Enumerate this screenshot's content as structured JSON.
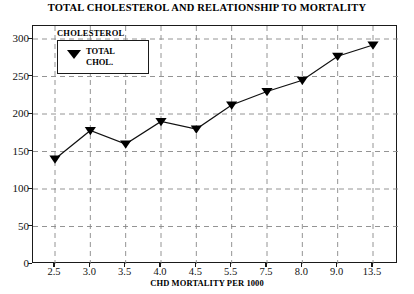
{
  "chart_data": {
    "type": "line",
    "title": "TOTAL CHOLESTEROL AND RELATIONSHIP TO MORTALITY",
    "xlabel": "CHD MORTALITY PER 1000",
    "ylabel": "",
    "categories": [
      "2.5",
      "3.0",
      "3.5",
      "4.0",
      "4.5",
      "5.5",
      "7.5",
      "8.0",
      "9.0",
      "13.5"
    ],
    "values": [
      140,
      178,
      160,
      190,
      180,
      212,
      230,
      245,
      277,
      292
    ],
    "series": [
      {
        "name": "TOTAL CHOL.",
        "values": [
          140,
          178,
          160,
          190,
          180,
          212,
          230,
          245,
          277,
          292
        ]
      }
    ],
    "ylim": [
      0,
      300
    ],
    "yticks": [
      0,
      50,
      100,
      150,
      200,
      250,
      300
    ],
    "ytick_labels": [
      "0",
      "50",
      "100",
      "150",
      "200",
      "250",
      "300"
    ],
    "grid": true,
    "grid_style": "dashed",
    "legend_position": "top-left",
    "marker": "triangle-down",
    "line_color": "#111111",
    "marker_color": "#000000",
    "grid_color": "#888888",
    "frame_color": "#1a1a1a",
    "background": "#ffffff"
  },
  "legend": {
    "title": "CHOLESTEROL",
    "entry_label_line1": "TOTAL",
    "entry_label_line2": "CHOL.",
    "marker_name": "triangle-down-marker"
  }
}
